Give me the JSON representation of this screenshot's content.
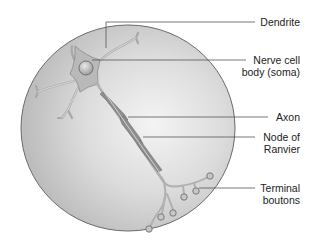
{
  "labels": {
    "dendrite": "Dendrite",
    "soma_line1": "Nerve cell",
    "soma_line2": "body (soma)",
    "axon": "Axon",
    "node_line1": "Node of",
    "node_line2": "Ranvier",
    "terminal_line1": "Terminal",
    "terminal_line2": "boutons"
  },
  "colors": {
    "circle_fill": "#cfcfcf",
    "circle_stroke": "#6a6a6a",
    "neuron_fill": "#b5b5b5",
    "myelin_fill": "#8c8c8c",
    "leader_line": "#555555"
  }
}
